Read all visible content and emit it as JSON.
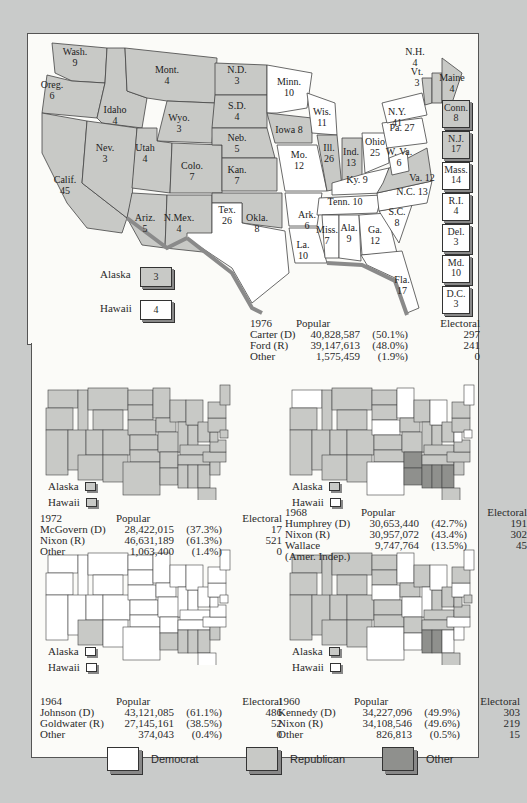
{
  "colors": {
    "democrat": "#ffffff",
    "republican": "#c8c9c6",
    "other": "#8f908d",
    "background": "#c9cbca",
    "paper": "#fbfbf8"
  },
  "map1976": {
    "states": [
      {
        "abbr": "Wash.",
        "ev": "9",
        "party": "R"
      },
      {
        "abbr": "Oreg.",
        "ev": "6",
        "party": "R"
      },
      {
        "abbr": "Calif.",
        "ev": "45",
        "party": "R"
      },
      {
        "abbr": "Idaho",
        "ev": "4",
        "party": "R"
      },
      {
        "abbr": "Nev.",
        "ev": "3",
        "party": "R"
      },
      {
        "abbr": "Mont.",
        "ev": "4",
        "party": "R"
      },
      {
        "abbr": "Wyo.",
        "ev": "3",
        "party": "R"
      },
      {
        "abbr": "Utah",
        "ev": "4",
        "party": "R"
      },
      {
        "abbr": "Colo.",
        "ev": "7",
        "party": "R"
      },
      {
        "abbr": "Ariz.",
        "ev": "5",
        "party": "R"
      },
      {
        "abbr": "N.Mex.",
        "ev": "4",
        "party": "R"
      },
      {
        "abbr": "N.D.",
        "ev": "3",
        "party": "R"
      },
      {
        "abbr": "S.D.",
        "ev": "4",
        "party": "R"
      },
      {
        "abbr": "Neb.",
        "ev": "5",
        "party": "R"
      },
      {
        "abbr": "Kan.",
        "ev": "7",
        "party": "R"
      },
      {
        "abbr": "Okla.",
        "ev": "8",
        "party": "R"
      },
      {
        "abbr": "Tex.",
        "ev": "26",
        "party": "D"
      },
      {
        "abbr": "Minn.",
        "ev": "10",
        "party": "D"
      },
      {
        "abbr": "Iowa",
        "ev": "8",
        "party": "R"
      },
      {
        "abbr": "Mo.",
        "ev": "12",
        "party": "D"
      },
      {
        "abbr": "Ark.",
        "ev": "6",
        "party": "D"
      },
      {
        "abbr": "La.",
        "ev": "10",
        "party": "D"
      },
      {
        "abbr": "Wis.",
        "ev": "11",
        "party": "D"
      },
      {
        "abbr": "Ill.",
        "ev": "26",
        "party": "R"
      },
      {
        "abbr": "Ind.",
        "ev": "13",
        "party": "R"
      },
      {
        "abbr": "Ohio",
        "ev": "25",
        "party": "D"
      },
      {
        "abbr": "Ky.",
        "ev": "9",
        "party": "D"
      },
      {
        "abbr": "Tenn.",
        "ev": "10",
        "party": "D"
      },
      {
        "abbr": "Miss.",
        "ev": "7",
        "party": "D"
      },
      {
        "abbr": "Ala.",
        "ev": "9",
        "party": "D"
      },
      {
        "abbr": "Ga.",
        "ev": "12",
        "party": "D"
      },
      {
        "abbr": "Fla.",
        "ev": "17",
        "party": "D"
      },
      {
        "abbr": "S.C.",
        "ev": "8",
        "party": "D"
      },
      {
        "abbr": "N.C.",
        "ev": "13",
        "party": "D"
      },
      {
        "abbr": "Va.",
        "ev": "12",
        "party": "R"
      },
      {
        "abbr": "W. Va.",
        "ev": "6",
        "party": "D"
      },
      {
        "abbr": "Pa.",
        "ev": "27",
        "party": "D"
      },
      {
        "abbr": "N.Y.",
        "ev": "41",
        "party": "D"
      },
      {
        "abbr": "Vt.",
        "ev": "3",
        "party": "R"
      },
      {
        "abbr": "N.H.",
        "ev": "4",
        "party": "R"
      },
      {
        "abbr": "Maine",
        "ev": "4",
        "party": "R"
      }
    ],
    "side_boxes": [
      {
        "abbr": "Conn.",
        "ev": "8",
        "party": "R"
      },
      {
        "abbr": "N.J.",
        "ev": "17",
        "party": "R"
      },
      {
        "abbr": "Mass.",
        "ev": "14",
        "party": "D"
      },
      {
        "abbr": "R.I.",
        "ev": "4",
        "party": "D"
      },
      {
        "abbr": "Del.",
        "ev": "3",
        "party": "D"
      },
      {
        "abbr": "Md.",
        "ev": "10",
        "party": "D"
      },
      {
        "abbr": "D.C.",
        "ev": "3",
        "party": "D"
      }
    ],
    "alaska": {
      "label": "Alaska",
      "ev": "3",
      "party": "R"
    },
    "hawaii": {
      "label": "Hawaii",
      "ev": "4",
      "party": "D"
    },
    "results": {
      "year": "1976",
      "popular_header": "Popular",
      "electoral_header": "Electoral",
      "rows": [
        {
          "name": "Carter (D)",
          "popular": "40,828,587",
          "pct": "(50.1%)",
          "electoral": "297"
        },
        {
          "name": "Ford (R)",
          "popular": "39,147,613",
          "pct": "(48.0%)",
          "electoral": "241"
        },
        {
          "name": "Other",
          "popular": "1,575,459",
          "pct": "(1.9%)",
          "electoral": "0"
        }
      ]
    }
  },
  "maps_small": [
    {
      "alaska_label": "Alaska",
      "hawaii_label": "Hawaii",
      "alaska_party": "R",
      "hawaii_party": "R",
      "winner_shading": "republican-nearly-all",
      "results": {
        "year": "1972",
        "popular_header": "Popular",
        "electoral_header": "Electoral",
        "rows": [
          {
            "name": "McGovern (D)",
            "popular": "28,422,015",
            "pct": "(37.3%)",
            "electoral": "17"
          },
          {
            "name": "Nixon (R)",
            "popular": "46,631,189",
            "pct": "(61.3%)",
            "electoral": "521"
          },
          {
            "name": "Other",
            "popular": "1,063,400",
            "pct": "(1.4%)",
            "electoral": "0"
          }
        ]
      }
    },
    {
      "alaska_label": "Alaska",
      "hawaii_label": "Hawaii",
      "alaska_party": "R",
      "hawaii_party": "D",
      "results": {
        "year": "1968",
        "popular_header": "Popular",
        "electoral_header": "Electoral",
        "rows": [
          {
            "name": "Humphrey (D)",
            "popular": "30,653,440",
            "pct": "(42.7%)",
            "electoral": "191"
          },
          {
            "name": "Nixon (R)",
            "popular": "30,957,072",
            "pct": "(43.4%)",
            "electoral": "302"
          },
          {
            "name": "Wallace",
            "popular": "9,747,764",
            "pct": "(13.5%)",
            "electoral": "45"
          },
          {
            "name": "(Amer. Indep.)",
            "popular": "",
            "pct": "",
            "electoral": ""
          }
        ]
      }
    },
    {
      "alaska_label": "Alaska",
      "hawaii_label": "Hawaii",
      "alaska_party": "D",
      "hawaii_party": "D",
      "results": {
        "year": "1964",
        "popular_header": "Popular",
        "electoral_header": "Electoral",
        "rows": [
          {
            "name": "Johnson (D)",
            "popular": "43,121,085",
            "pct": "(61.1%)",
            "electoral": "486"
          },
          {
            "name": "Goldwater (R)",
            "popular": "27,145,161",
            "pct": "(38.5%)",
            "electoral": "52"
          },
          {
            "name": "Other",
            "popular": "374,043",
            "pct": "(0.4%)",
            "electoral": "0"
          }
        ]
      }
    },
    {
      "alaska_label": "Alaska",
      "hawaii_label": "Hawaii",
      "alaska_party": "R",
      "hawaii_party": "D",
      "results": {
        "year": "1960",
        "popular_header": "Popular",
        "electoral_header": "Electoral",
        "rows": [
          {
            "name": "Kennedy (D)",
            "popular": "34,227,096",
            "pct": "(49.9%)",
            "electoral": "303"
          },
          {
            "name": "Nixon (R)",
            "popular": "34,108,546",
            "pct": "(49.6%)",
            "electoral": "219"
          },
          {
            "name": "Other",
            "popular": "826,813",
            "pct": "(0.5%)",
            "electoral": "15"
          }
        ]
      }
    }
  ],
  "legend": [
    {
      "label": "Democrat",
      "party": "D"
    },
    {
      "label": "Republican",
      "party": "R"
    },
    {
      "label": "Other",
      "party": "O"
    }
  ]
}
